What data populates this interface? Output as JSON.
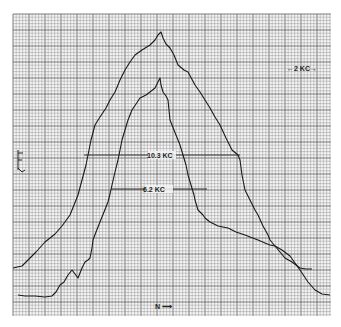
{
  "chart_data": {
    "type": "line",
    "title": "",
    "xlabel": "",
    "ylabel": "",
    "grid": true,
    "legend": [],
    "annotations": [
      {
        "text": "10.3 KC",
        "kind": "width-marker",
        "series": "outer",
        "y_px": 155,
        "x1_px": 84,
        "x2_px": 240
      },
      {
        "text": "6.2 KC",
        "kind": "width-marker",
        "series": "inner",
        "y_px": 189,
        "x1_px": 111,
        "x2_px": 207
      },
      {
        "text": "←2 KC→",
        "kind": "scale-bar",
        "x_px": 303,
        "y_px": 68
      },
      {
        "text": "F ↓",
        "kind": "axis-marker-left",
        "x_px": 18,
        "y_px": 160
      },
      {
        "text": "N ⟶",
        "kind": "axis-marker-bottom",
        "x_px": 160,
        "y_px": 307
      }
    ],
    "series": [
      {
        "name": "outer",
        "description": "wider spectral curve, half-width 10.3 KC",
        "points_px": [
          [
            13,
            268
          ],
          [
            22,
            266
          ],
          [
            28,
            260
          ],
          [
            36,
            252
          ],
          [
            45,
            242
          ],
          [
            55,
            234
          ],
          [
            62,
            226
          ],
          [
            70,
            215
          ],
          [
            74,
            205
          ],
          [
            78,
            195
          ],
          [
            82,
            180
          ],
          [
            86,
            165
          ],
          [
            88,
            155
          ],
          [
            91,
            140
          ],
          [
            95,
            125
          ],
          [
            100,
            117
          ],
          [
            106,
            108
          ],
          [
            110,
            100
          ],
          [
            115,
            92
          ],
          [
            120,
            80
          ],
          [
            125,
            70
          ],
          [
            130,
            62
          ],
          [
            135,
            55
          ],
          [
            142,
            50
          ],
          [
            150,
            45
          ],
          [
            155,
            40
          ],
          [
            158,
            35
          ],
          [
            161,
            32
          ],
          [
            163,
            38
          ],
          [
            166,
            44
          ],
          [
            170,
            48
          ],
          [
            174,
            55
          ],
          [
            178,
            65
          ],
          [
            184,
            70
          ],
          [
            188,
            72
          ],
          [
            195,
            85
          ],
          [
            200,
            92
          ],
          [
            205,
            100
          ],
          [
            210,
            108
          ],
          [
            215,
            117
          ],
          [
            220,
            125
          ],
          [
            226,
            138
          ],
          [
            232,
            150
          ],
          [
            238,
            155
          ],
          [
            240,
            160
          ],
          [
            242,
            175
          ],
          [
            245,
            190
          ],
          [
            250,
            200
          ],
          [
            255,
            210
          ],
          [
            258,
            215
          ],
          [
            263,
            226
          ],
          [
            268,
            235
          ],
          [
            270,
            240
          ],
          [
            275,
            246
          ],
          [
            280,
            252
          ],
          [
            285,
            258
          ],
          [
            292,
            262
          ],
          [
            300,
            268
          ],
          [
            306,
            269
          ],
          [
            312,
            269
          ]
        ]
      },
      {
        "name": "inner",
        "description": "narrower spectral curve, half-width 6.2 KC",
        "points_px": [
          [
            18,
            295
          ],
          [
            25,
            296
          ],
          [
            35,
            296
          ],
          [
            45,
            297
          ],
          [
            52,
            296
          ],
          [
            56,
            292
          ],
          [
            60,
            285
          ],
          [
            64,
            282
          ],
          [
            68,
            275
          ],
          [
            72,
            270
          ],
          [
            75,
            274
          ],
          [
            78,
            278
          ],
          [
            82,
            268
          ],
          [
            85,
            262
          ],
          [
            88,
            260
          ],
          [
            90,
            258
          ],
          [
            92,
            248
          ],
          [
            93,
            240
          ],
          [
            96,
            232
          ],
          [
            100,
            222
          ],
          [
            104,
            212
          ],
          [
            108,
            202
          ],
          [
            110,
            194
          ],
          [
            112,
            185
          ],
          [
            115,
            172
          ],
          [
            118,
            160
          ],
          [
            120,
            150
          ],
          [
            122,
            140
          ],
          [
            125,
            130
          ],
          [
            128,
            120
          ],
          [
            132,
            110
          ],
          [
            136,
            104
          ],
          [
            140,
            98
          ],
          [
            146,
            95
          ],
          [
            150,
            92
          ],
          [
            155,
            88
          ],
          [
            158,
            82
          ],
          [
            160,
            78
          ],
          [
            161,
            85
          ],
          [
            163,
            92
          ],
          [
            166,
            96
          ],
          [
            168,
            100
          ],
          [
            169,
            110
          ],
          [
            170,
            120
          ],
          [
            174,
            130
          ],
          [
            178,
            140
          ],
          [
            180,
            145
          ],
          [
            183,
            155
          ],
          [
            186,
            165
          ],
          [
            188,
            175
          ],
          [
            191,
            185
          ],
          [
            194,
            195
          ],
          [
            195,
            200
          ],
          [
            198,
            210
          ],
          [
            203,
            215
          ],
          [
            205,
            218
          ],
          [
            210,
            222
          ],
          [
            218,
            226
          ],
          [
            228,
            228
          ],
          [
            236,
            232
          ],
          [
            245,
            235
          ],
          [
            250,
            237
          ],
          [
            258,
            240
          ],
          [
            265,
            243
          ],
          [
            270,
            245
          ],
          [
            275,
            246
          ],
          [
            282,
            250
          ],
          [
            290,
            256
          ],
          [
            300,
            270
          ],
          [
            308,
            282
          ],
          [
            315,
            290
          ],
          [
            322,
            294
          ],
          [
            330,
            295
          ]
        ]
      }
    ],
    "plot_area_px": {
      "x0": 13,
      "y0": 14,
      "x1": 331,
      "y1": 316
    },
    "grid_minor_px": 3.2,
    "grid_major_every": 5
  },
  "labels": {
    "outer_width": "10.3 KC",
    "inner_width": "6.2 KC",
    "scale": "←2 KC→",
    "left_marker": "F",
    "bottom_marker": "N ⟶"
  },
  "colors": {
    "grid_minor": "#9a9a9a",
    "grid_major": "#5a5a5a",
    "trace": "#1a1a1a",
    "background": "#f4f4f4"
  }
}
